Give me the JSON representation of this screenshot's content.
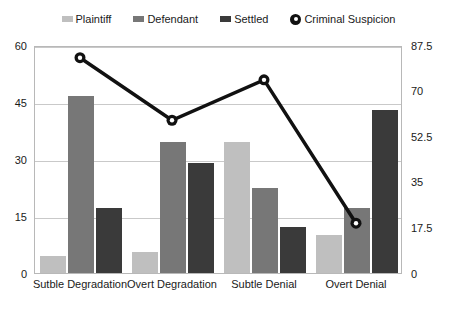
{
  "chart_data": {
    "type": "bar",
    "title": "",
    "subtitle": "",
    "xlabel": "",
    "ylabel": "",
    "y2label": "",
    "categories": [
      "Sutble Degradation",
      "Overt Degradation",
      "Subtle Denial",
      "Overt Denial"
    ],
    "series": [
      {
        "name": "Plaintiff",
        "type": "bar",
        "axis": "left",
        "color": "#bfbfbf",
        "values": [
          4.5,
          5.5,
          34.5,
          10
        ]
      },
      {
        "name": "Defendant",
        "type": "bar",
        "axis": "left",
        "color": "#777777",
        "values": [
          46.5,
          34.5,
          22.5,
          17
        ]
      },
      {
        "name": "Settled",
        "type": "bar",
        "axis": "left",
        "color": "#3a3a3a",
        "values": [
          17,
          29,
          12,
          43
        ]
      },
      {
        "name": "Criminal Suspicion",
        "type": "line",
        "axis": "right",
        "color": "#111111",
        "values": [
          83,
          59,
          74.5,
          19.5
        ]
      }
    ],
    "ylim": [
      0,
      60
    ],
    "yticks": [
      0,
      15,
      30,
      45,
      60
    ],
    "y2lim": [
      0,
      87.5
    ],
    "y2ticks": [
      0,
      17.5,
      35,
      52.5,
      70,
      87.5
    ],
    "grid": true,
    "legend_position": "top",
    "legend_entries": [
      "Plaintiff",
      "Defendant",
      "Settled",
      "Criminal Suspicion"
    ],
    "marker_shape": "circle-open",
    "plot_border_color": "#b8b8b8",
    "gridline_color": "#c9c9c9",
    "background_color": "#ffffff"
  }
}
